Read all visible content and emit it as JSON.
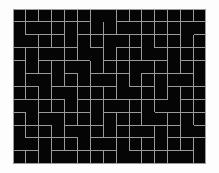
{
  "image": {
    "title": "maze-grid-image",
    "width": 219,
    "height": 173,
    "background_color": "#fdfdfd"
  },
  "maze": {
    "name": "rectangular-perfect-maze",
    "cols": 15,
    "rows": 12,
    "origin_x": 13,
    "origin_y": 9,
    "cell_size": 12.9,
    "wall_thickness": 1,
    "wall_color": "#9a9a9a",
    "floor_color": "#050505",
    "border_color": "#9a9a9a",
    "h_walls": [
      [
        1,
        1,
        1,
        1,
        1,
        1,
        1,
        1,
        1,
        1,
        1,
        1,
        1,
        1,
        1
      ],
      [
        1,
        1,
        1,
        1,
        1,
        1,
        0,
        0,
        1,
        1,
        1,
        1,
        1,
        1,
        1
      ],
      [
        0,
        1,
        1,
        1,
        0,
        1,
        1,
        1,
        1,
        1,
        1,
        1,
        1,
        0,
        1
      ],
      [
        1,
        1,
        1,
        1,
        1,
        0,
        1,
        0,
        1,
        1,
        0,
        1,
        1,
        1,
        1
      ],
      [
        1,
        0,
        1,
        1,
        1,
        1,
        0,
        1,
        1,
        1,
        1,
        1,
        0,
        1,
        1
      ],
      [
        0,
        1,
        1,
        0,
        1,
        0,
        1,
        1,
        1,
        0,
        1,
        1,
        1,
        1,
        0
      ],
      [
        1,
        1,
        0,
        1,
        1,
        1,
        1,
        1,
        0,
        1,
        1,
        0,
        1,
        1,
        1
      ],
      [
        1,
        1,
        1,
        1,
        0,
        1,
        1,
        1,
        1,
        1,
        1,
        1,
        0,
        1,
        1
      ],
      [
        1,
        0,
        1,
        1,
        1,
        1,
        0,
        1,
        1,
        1,
        0,
        1,
        1,
        1,
        1
      ],
      [
        1,
        1,
        1,
        0,
        1,
        1,
        1,
        0,
        1,
        1,
        1,
        1,
        1,
        0,
        1
      ],
      [
        0,
        1,
        1,
        1,
        1,
        0,
        1,
        1,
        1,
        1,
        1,
        0,
        1,
        1,
        1
      ],
      [
        1,
        1,
        0,
        1,
        1,
        1,
        1,
        1,
        0,
        1,
        1,
        1,
        1,
        1,
        0
      ],
      [
        1,
        1,
        1,
        1,
        1,
        1,
        1,
        1,
        1,
        1,
        1,
        1,
        1,
        1,
        1
      ]
    ],
    "v_walls": [
      [
        1,
        1,
        1,
        1,
        1,
        1,
        1,
        0,
        1,
        1,
        1,
        1,
        1,
        1,
        1,
        1
      ],
      [
        1,
        1,
        0,
        1,
        1,
        1,
        1,
        1,
        1,
        0,
        1,
        1,
        1,
        1,
        0,
        1
      ],
      [
        1,
        0,
        1,
        1,
        1,
        1,
        1,
        1,
        0,
        1,
        1,
        1,
        1,
        1,
        1,
        1
      ],
      [
        1,
        1,
        1,
        0,
        1,
        1,
        0,
        1,
        1,
        1,
        1,
        0,
        1,
        1,
        1,
        1
      ],
      [
        1,
        1,
        1,
        1,
        1,
        0,
        1,
        1,
        1,
        1,
        0,
        1,
        1,
        1,
        1,
        1
      ],
      [
        1,
        1,
        0,
        1,
        1,
        1,
        1,
        0,
        1,
        1,
        1,
        1,
        1,
        0,
        1,
        1
      ],
      [
        1,
        1,
        1,
        1,
        0,
        1,
        1,
        1,
        1,
        0,
        1,
        1,
        1,
        1,
        1,
        1
      ],
      [
        1,
        0,
        1,
        1,
        1,
        1,
        1,
        1,
        0,
        1,
        1,
        1,
        0,
        1,
        1,
        1
      ],
      [
        1,
        1,
        1,
        0,
        1,
        1,
        1,
        1,
        1,
        1,
        1,
        0,
        1,
        1,
        1,
        1
      ],
      [
        1,
        1,
        1,
        1,
        1,
        0,
        1,
        1,
        1,
        1,
        0,
        1,
        1,
        1,
        0,
        1
      ],
      [
        1,
        0,
        1,
        1,
        1,
        1,
        1,
        0,
        1,
        1,
        1,
        1,
        1,
        1,
        1,
        1
      ],
      [
        1,
        1,
        1,
        1,
        0,
        1,
        1,
        1,
        1,
        0,
        1,
        1,
        1,
        0,
        1,
        1
      ]
    ]
  }
}
